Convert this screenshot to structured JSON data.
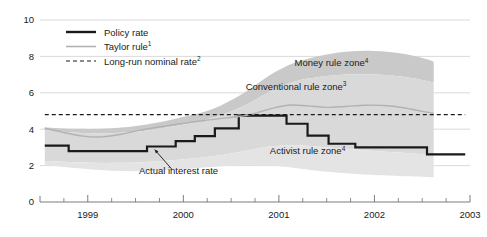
{
  "chart_data": {
    "type": "line",
    "title": "",
    "xlabel": "",
    "ylabel": "",
    "xlim": [
      1998.5,
      2003.0
    ],
    "ylim": [
      0,
      10
    ],
    "grid": true,
    "legend_position": "top-left",
    "y_ticks": [
      "0",
      "2",
      "4",
      "6",
      "8",
      "10"
    ],
    "y_tick_values": [
      0,
      2,
      4,
      6,
      8,
      10
    ],
    "x_ticks": [
      "1999",
      "2000",
      "2001",
      "2002",
      "2003"
    ],
    "x_tick_values": [
      1999,
      2000,
      2001,
      2002,
      2003
    ],
    "x_minor_tick_values": [
      1998.75,
      1999.25,
      1999.5,
      1999.75,
      2000.25,
      2000.5,
      2000.75,
      2001.25,
      2001.5,
      2001.75,
      2002.25,
      2002.5,
      2002.75
    ],
    "series": [
      {
        "name": "Policy rate",
        "style": "step",
        "color": "#1a1a1a",
        "width": 2.2,
        "x": [
          1998.55,
          1998.8,
          1998.8,
          1999.08,
          1999.08,
          1999.62,
          1999.62,
          1999.92,
          1999.92,
          2000.12,
          2000.12,
          2000.33,
          2000.33,
          2000.58,
          2000.58,
          2001.08,
          2001.08,
          2001.3,
          2001.3,
          2001.52,
          2001.52,
          2001.8,
          2001.8,
          2002.55,
          2002.55,
          2002.95
        ],
        "y": [
          3.1,
          3.1,
          2.8,
          2.8,
          2.8,
          2.8,
          3.05,
          3.05,
          3.35,
          3.35,
          3.62,
          3.62,
          4.05,
          4.05,
          4.75,
          4.75,
          4.3,
          4.3,
          3.65,
          3.65,
          3.2,
          3.2,
          3.0,
          3.0,
          2.62,
          2.62
        ]
      },
      {
        "name": "Taylor rule",
        "superscript": "1",
        "style": "smooth",
        "color": "#b2b2b2",
        "width": 1.4,
        "x": [
          1998.55,
          1998.75,
          1998.95,
          1999.15,
          1999.35,
          1999.55,
          1999.78,
          2000.0,
          2000.22,
          2000.45,
          2000.68,
          2000.9,
          2001.1,
          2001.3,
          2001.5,
          2001.7,
          2001.9,
          2002.1,
          2002.3,
          2002.5,
          2002.62
        ],
        "y": [
          4.05,
          3.82,
          3.62,
          3.58,
          3.72,
          3.95,
          4.15,
          4.32,
          4.48,
          4.62,
          4.78,
          5.1,
          5.32,
          5.28,
          5.2,
          5.25,
          5.32,
          5.3,
          5.18,
          4.98,
          4.88
        ]
      },
      {
        "name": "Long-run nominal rate",
        "superscript": "2",
        "style": "dashed",
        "color": "#1a1a1a",
        "width": 1.1,
        "value": 4.8,
        "x": [
          1998.55,
          2002.95
        ],
        "y": [
          4.8,
          4.8
        ]
      }
    ],
    "bands": [
      {
        "name": "Money rule zone",
        "superscript": "4",
        "color": "#c9c9c9",
        "label_x": 2001.55,
        "label_y": 7.45,
        "x": [
          1998.55,
          1998.9,
          1999.25,
          1999.6,
          1999.95,
          2000.3,
          2000.62,
          2000.9,
          2001.15,
          2001.4,
          2001.7,
          2002.0,
          2002.3,
          2002.55,
          2002.62
        ],
        "upper": [
          4.1,
          4.02,
          4.05,
          4.25,
          4.62,
          5.1,
          5.95,
          6.95,
          7.62,
          8.0,
          8.25,
          8.3,
          8.15,
          7.85,
          7.7
        ],
        "lower": [
          3.95,
          3.8,
          3.78,
          3.92,
          4.2,
          4.62,
          5.25,
          6.05,
          6.6,
          6.85,
          7.0,
          7.0,
          6.88,
          6.65,
          6.55
        ]
      },
      {
        "name": "Conventional rule zone",
        "superscript": "3",
        "color": "#d9d9d9",
        "label_x": 2001.18,
        "label_y": 6.18,
        "x": [
          1998.55,
          1998.9,
          1999.25,
          1999.6,
          1999.95,
          2000.3,
          2000.62,
          2000.9,
          2001.15,
          2001.4,
          2001.7,
          2002.0,
          2002.3,
          2002.55,
          2002.62
        ],
        "upper": [
          3.95,
          3.8,
          3.78,
          3.92,
          4.2,
          4.62,
          5.25,
          6.05,
          6.6,
          6.85,
          7.0,
          7.0,
          6.88,
          6.65,
          6.55
        ],
        "lower": [
          2.25,
          2.18,
          2.15,
          2.2,
          2.32,
          2.52,
          2.78,
          3.05,
          3.12,
          3.05,
          2.92,
          2.8,
          2.7,
          2.6,
          2.55
        ]
      },
      {
        "name": "Activist rule zone",
        "superscript": "4",
        "color": "#e4e4e4",
        "label_x": 2001.3,
        "label_y": 2.62,
        "x": [
          1998.55,
          1998.9,
          1999.25,
          1999.6,
          1999.95,
          2000.3,
          2000.62,
          2000.9,
          2001.15,
          2001.4,
          2001.7,
          2002.0,
          2002.3,
          2002.55,
          2002.62
        ],
        "upper": [
          2.25,
          2.18,
          2.15,
          2.2,
          2.32,
          2.52,
          2.78,
          3.05,
          3.12,
          3.05,
          2.92,
          2.8,
          2.7,
          2.6,
          2.55
        ],
        "lower": [
          2.05,
          1.85,
          1.72,
          1.7,
          1.78,
          1.92,
          2.02,
          2.0,
          1.88,
          1.72,
          1.58,
          1.48,
          1.42,
          1.38,
          1.36
        ]
      }
    ],
    "annotations": [
      {
        "name": "actual-interest-rate",
        "text": "Actual interest rate",
        "text_x": 1999.95,
        "text_y": 1.55,
        "leader_from_x": 1999.88,
        "leader_from_y": 1.8,
        "leader_to_x": 1999.7,
        "leader_to_y": 2.88
      }
    ]
  },
  "legend": {
    "items": [
      {
        "label": "Policy rate",
        "superscript": "",
        "swatch": "solid-dark"
      },
      {
        "label": "Taylor rule",
        "superscript": "1",
        "swatch": "solid-gray"
      },
      {
        "label": "Long-run nominal rate",
        "superscript": "2",
        "swatch": "dashed-dark"
      }
    ]
  },
  "colors": {
    "background": "#ffffff",
    "grid": "#d0d0d0",
    "axis": "#6e6e6e",
    "text": "#1a1a1a",
    "policy_rate": "#1a1a1a",
    "taylor_rule": "#b2b2b2",
    "band_money": "#c9c9c9",
    "band_conventional": "#d9d9d9",
    "band_activist": "#e4e4e4"
  }
}
